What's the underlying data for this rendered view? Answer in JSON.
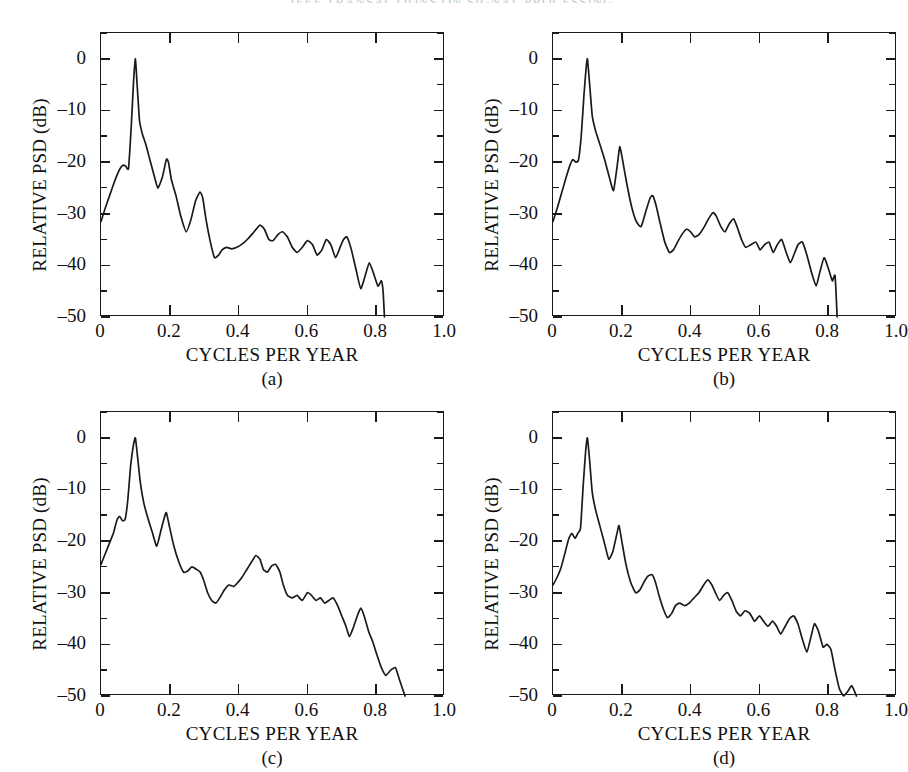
{
  "page": {
    "running_head": "IEEE TRANSACTIONS ON SIGNAL PROCESSING"
  },
  "axes": {
    "ylabel": "RELATIVE PSD (dB)",
    "xlabel": "CYCLES PER YEAR",
    "ytick_labels": [
      "0",
      "–10",
      "–20",
      "–30",
      "–40",
      "–50"
    ],
    "xtick_labels": [
      "0",
      "0.2",
      "0.4",
      "0.6",
      "0.8",
      "1.0"
    ],
    "ylim": [
      -50,
      5
    ],
    "xlim": [
      0,
      1.0
    ],
    "ytick_values": [
      0,
      -10,
      -20,
      -30,
      -40,
      -50
    ],
    "xtick_values": [
      0,
      0.2,
      0.4,
      0.6,
      0.8,
      1.0
    ],
    "yminor_step": 5,
    "grid": false
  },
  "panels": [
    {
      "id": "a",
      "tag": "(a)"
    },
    {
      "id": "b",
      "tag": "(b)"
    },
    {
      "id": "c",
      "tag": "(c)"
    },
    {
      "id": "d",
      "tag": "(d)"
    }
  ],
  "chart_data": [
    {
      "type": "line",
      "title": "(a)",
      "xlabel": "CYCLES PER YEAR",
      "ylabel": "RELATIVE PSD (dB)",
      "xlim": [
        0,
        1.0
      ],
      "ylim": [
        -50,
        5
      ],
      "grid": false,
      "legend": "none",
      "series": [
        {
          "name": "psd-a",
          "x": [
            0.0,
            0.012,
            0.025,
            0.038,
            0.05,
            0.058,
            0.065,
            0.072,
            0.08,
            0.088,
            0.095,
            0.1,
            0.105,
            0.112,
            0.12,
            0.13,
            0.14,
            0.152,
            0.165,
            0.178,
            0.19,
            0.196,
            0.205,
            0.218,
            0.232,
            0.248,
            0.262,
            0.275,
            0.288,
            0.296,
            0.305,
            0.318,
            0.33,
            0.342,
            0.352,
            0.365,
            0.38,
            0.395,
            0.412,
            0.428,
            0.445,
            0.462,
            0.475,
            0.488,
            0.5,
            0.515,
            0.528,
            0.542,
            0.556,
            0.57,
            0.585,
            0.6,
            0.615,
            0.628,
            0.642,
            0.655,
            0.668,
            0.682,
            0.695,
            0.705,
            0.715,
            0.728,
            0.742,
            0.755,
            0.768,
            0.78,
            0.792,
            0.805,
            0.815,
            0.82,
            0.824
          ],
          "y": [
            -31.5,
            -29.0,
            -26.5,
            -24.0,
            -22.0,
            -21.0,
            -20.6,
            -20.8,
            -21.2,
            -13.0,
            -4.0,
            0.0,
            -5.0,
            -12.0,
            -14.5,
            -16.5,
            -19.0,
            -22.0,
            -25.0,
            -23.0,
            -19.5,
            -20.0,
            -23.5,
            -26.5,
            -30.5,
            -33.5,
            -31.0,
            -27.5,
            -25.8,
            -27.0,
            -31.0,
            -35.5,
            -38.5,
            -38.0,
            -37.0,
            -36.5,
            -36.8,
            -36.5,
            -35.8,
            -34.8,
            -33.5,
            -32.2,
            -33.0,
            -35.0,
            -35.2,
            -34.0,
            -33.5,
            -34.5,
            -36.5,
            -37.5,
            -36.5,
            -35.2,
            -36.0,
            -38.0,
            -37.0,
            -35.0,
            -36.0,
            -38.5,
            -36.5,
            -35.0,
            -34.5,
            -37.0,
            -41.0,
            -44.5,
            -42.0,
            -39.5,
            -41.5,
            -44.0,
            -43.0,
            -45.0,
            -50.0
          ]
        }
      ]
    },
    {
      "type": "line",
      "title": "(b)",
      "xlabel": "CYCLES PER YEAR",
      "ylabel": "RELATIVE PSD (dB)",
      "xlim": [
        0,
        1.0
      ],
      "ylim": [
        -50,
        5
      ],
      "grid": false,
      "legend": "none",
      "series": [
        {
          "name": "psd-b",
          "x": [
            0.0,
            0.012,
            0.025,
            0.038,
            0.05,
            0.058,
            0.066,
            0.074,
            0.082,
            0.09,
            0.096,
            0.1,
            0.106,
            0.114,
            0.124,
            0.136,
            0.15,
            0.164,
            0.176,
            0.188,
            0.194,
            0.202,
            0.214,
            0.228,
            0.242,
            0.256,
            0.27,
            0.282,
            0.29,
            0.3,
            0.312,
            0.325,
            0.338,
            0.35,
            0.362,
            0.375,
            0.388,
            0.4,
            0.412,
            0.425,
            0.44,
            0.452,
            0.465,
            0.475,
            0.488,
            0.5,
            0.512,
            0.525,
            0.535,
            0.548,
            0.56,
            0.575,
            0.59,
            0.602,
            0.615,
            0.628,
            0.64,
            0.652,
            0.665,
            0.678,
            0.69,
            0.7,
            0.712,
            0.725,
            0.738,
            0.752,
            0.765,
            0.775,
            0.788,
            0.8,
            0.812,
            0.82,
            0.826
          ],
          "y": [
            -31.5,
            -29.0,
            -26.0,
            -23.0,
            -20.5,
            -19.5,
            -20.0,
            -19.6,
            -15.0,
            -7.0,
            -2.0,
            0.0,
            -4.5,
            -11.0,
            -14.0,
            -16.5,
            -19.5,
            -23.0,
            -25.5,
            -20.0,
            -17.0,
            -19.5,
            -24.0,
            -28.5,
            -31.5,
            -32.5,
            -29.5,
            -27.0,
            -26.5,
            -28.5,
            -32.0,
            -35.5,
            -37.5,
            -37.0,
            -35.5,
            -34.0,
            -33.0,
            -33.5,
            -34.5,
            -34.0,
            -32.5,
            -31.0,
            -29.8,
            -30.5,
            -32.5,
            -33.5,
            -32.0,
            -31.0,
            -32.5,
            -35.0,
            -36.5,
            -36.0,
            -35.5,
            -37.0,
            -36.0,
            -35.5,
            -37.5,
            -36.0,
            -35.0,
            -37.5,
            -39.5,
            -38.0,
            -36.0,
            -35.5,
            -38.0,
            -41.5,
            -44.0,
            -41.5,
            -38.5,
            -40.5,
            -43.0,
            -42.0,
            -50.0
          ]
        }
      ]
    },
    {
      "type": "line",
      "title": "(c)",
      "xlabel": "CYCLES PER YEAR",
      "ylabel": "RELATIVE PSD (dB)",
      "xlim": [
        0,
        1.0
      ],
      "ylim": [
        -50,
        5
      ],
      "grid": false,
      "legend": "none",
      "series": [
        {
          "name": "psd-c",
          "x": [
            0.0,
            0.012,
            0.024,
            0.036,
            0.046,
            0.054,
            0.062,
            0.07,
            0.078,
            0.086,
            0.094,
            0.1,
            0.106,
            0.114,
            0.124,
            0.136,
            0.15,
            0.162,
            0.174,
            0.184,
            0.19,
            0.2,
            0.212,
            0.226,
            0.24,
            0.252,
            0.264,
            0.278,
            0.288,
            0.298,
            0.31,
            0.322,
            0.334,
            0.345,
            0.358,
            0.372,
            0.386,
            0.398,
            0.41,
            0.424,
            0.438,
            0.45,
            0.462,
            0.472,
            0.484,
            0.496,
            0.508,
            0.52,
            0.53,
            0.542,
            0.556,
            0.57,
            0.585,
            0.6,
            0.612,
            0.625,
            0.638,
            0.65,
            0.662,
            0.675,
            0.688,
            0.7,
            0.712,
            0.722,
            0.732,
            0.745,
            0.755,
            0.765,
            0.778,
            0.79,
            0.802,
            0.815,
            0.828,
            0.842,
            0.856,
            0.866,
            0.876,
            0.884
          ],
          "y": [
            -24.5,
            -22.5,
            -20.5,
            -18.5,
            -16.0,
            -15.2,
            -16.0,
            -15.8,
            -12.0,
            -5.5,
            -1.5,
            0.0,
            -3.5,
            -8.5,
            -12.5,
            -15.5,
            -18.5,
            -21.0,
            -18.0,
            -15.5,
            -14.5,
            -17.5,
            -21.0,
            -24.0,
            -26.0,
            -25.8,
            -25.0,
            -25.5,
            -26.0,
            -27.5,
            -30.0,
            -31.5,
            -32.0,
            -31.0,
            -29.5,
            -28.5,
            -28.8,
            -28.0,
            -27.0,
            -25.5,
            -24.0,
            -22.8,
            -23.5,
            -25.5,
            -26.0,
            -24.8,
            -24.5,
            -26.0,
            -28.5,
            -30.5,
            -31.0,
            -30.5,
            -31.5,
            -30.0,
            -30.5,
            -31.5,
            -31.0,
            -32.0,
            -31.5,
            -31.0,
            -32.5,
            -34.5,
            -36.5,
            -38.5,
            -37.0,
            -34.5,
            -33.0,
            -34.5,
            -37.5,
            -39.5,
            -42.0,
            -44.5,
            -46.0,
            -45.0,
            -44.5,
            -46.5,
            -48.5,
            -50.0
          ]
        }
      ]
    },
    {
      "type": "line",
      "title": "(d)",
      "xlabel": "CYCLES PER YEAR",
      "ylabel": "RELATIVE PSD (dB)",
      "xlim": [
        0,
        1.0
      ],
      "ylim": [
        -50,
        5
      ],
      "grid": false,
      "legend": "none",
      "series": [
        {
          "name": "psd-d",
          "x": [
            0.0,
            0.012,
            0.024,
            0.036,
            0.046,
            0.055,
            0.064,
            0.072,
            0.08,
            0.088,
            0.095,
            0.1,
            0.106,
            0.114,
            0.124,
            0.136,
            0.15,
            0.162,
            0.174,
            0.186,
            0.192,
            0.2,
            0.212,
            0.226,
            0.24,
            0.252,
            0.264,
            0.276,
            0.288,
            0.298,
            0.308,
            0.32,
            0.332,
            0.345,
            0.356,
            0.368,
            0.382,
            0.396,
            0.41,
            0.424,
            0.438,
            0.45,
            0.462,
            0.472,
            0.484,
            0.496,
            0.508,
            0.52,
            0.532,
            0.545,
            0.558,
            0.572,
            0.586,
            0.6,
            0.612,
            0.625,
            0.638,
            0.65,
            0.662,
            0.675,
            0.688,
            0.7,
            0.712,
            0.725,
            0.738,
            0.75,
            0.76,
            0.772,
            0.785,
            0.796,
            0.808,
            0.82,
            0.832,
            0.845,
            0.858,
            0.868,
            0.876,
            0.882
          ],
          "y": [
            -28.5,
            -27.0,
            -25.0,
            -22.0,
            -19.5,
            -18.5,
            -19.5,
            -18.5,
            -17.5,
            -9.0,
            -2.5,
            0.0,
            -4.0,
            -10.5,
            -14.0,
            -17.0,
            -20.5,
            -23.5,
            -22.0,
            -18.5,
            -17.0,
            -20.0,
            -24.5,
            -28.0,
            -30.0,
            -29.5,
            -28.0,
            -26.8,
            -26.5,
            -28.0,
            -30.5,
            -33.0,
            -34.8,
            -34.0,
            -32.5,
            -32.0,
            -32.5,
            -32.0,
            -31.0,
            -30.0,
            -28.5,
            -27.5,
            -28.5,
            -30.0,
            -31.5,
            -30.5,
            -30.0,
            -31.5,
            -33.5,
            -34.5,
            -33.5,
            -34.0,
            -35.5,
            -34.5,
            -35.5,
            -36.5,
            -35.5,
            -36.5,
            -38.0,
            -36.5,
            -35.0,
            -34.5,
            -36.0,
            -39.0,
            -41.5,
            -38.5,
            -36.0,
            -37.5,
            -40.5,
            -40.0,
            -41.0,
            -45.0,
            -48.5,
            -50.0,
            -49.0,
            -48.0,
            -49.0,
            -50.0
          ]
        }
      ]
    }
  ]
}
